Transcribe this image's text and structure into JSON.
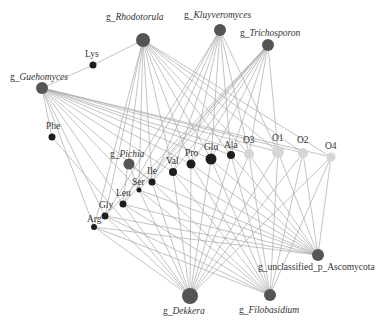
{
  "diagram": {
    "type": "network",
    "colors": {
      "fungus": "#555555",
      "amino_acid": "#1e1e1e",
      "organic_acid": "#d6d6d6",
      "edge": "#a8a8a8",
      "label": "#333333"
    },
    "nodes": [
      {
        "id": "rhodotorula",
        "prefix": "g_",
        "name": "Rhodotorula",
        "italic": true,
        "group": "fungus",
        "x": 143,
        "y": 40,
        "r": 7,
        "lx": 106,
        "ly": 20
      },
      {
        "id": "kluyveromyces",
        "prefix": "g_",
        "name": "Kluyveromyces",
        "italic": true,
        "group": "fungus",
        "x": 220,
        "y": 30,
        "r": 6,
        "lx": 184,
        "ly": 18
      },
      {
        "id": "trichosporon",
        "prefix": "g_",
        "name": "Trichosporon",
        "italic": true,
        "group": "fungus",
        "x": 268,
        "y": 45,
        "r": 6,
        "lx": 240,
        "ly": 36
      },
      {
        "id": "lys",
        "prefix": "",
        "name": "Lys",
        "italic": false,
        "group": "amino_acid",
        "x": 93,
        "y": 65,
        "r": 3.5,
        "lx": 85,
        "ly": 57
      },
      {
        "id": "guehomyces",
        "prefix": "g_",
        "name": "Guehomyces",
        "italic": true,
        "group": "fungus",
        "x": 42,
        "y": 88,
        "r": 6,
        "lx": 10,
        "ly": 80
      },
      {
        "id": "phe",
        "prefix": "",
        "name": "Phe",
        "italic": false,
        "group": "amino_acid",
        "x": 52,
        "y": 137,
        "r": 3.5,
        "lx": 46,
        "ly": 129
      },
      {
        "id": "pichia",
        "prefix": "g_",
        "name": "Pichia",
        "italic": true,
        "group": "fungus",
        "x": 129,
        "y": 164,
        "r": 5.5,
        "lx": 110,
        "ly": 157
      },
      {
        "id": "val",
        "prefix": "",
        "name": "Val",
        "italic": false,
        "group": "amino_acid",
        "x": 173,
        "y": 172,
        "r": 4,
        "lx": 166,
        "ly": 164
      },
      {
        "id": "pro",
        "prefix": "",
        "name": "Pro",
        "italic": false,
        "group": "amino_acid",
        "x": 191,
        "y": 164,
        "r": 4.5,
        "lx": 185,
        "ly": 156
      },
      {
        "id": "glu",
        "prefix": "",
        "name": "Glu",
        "italic": false,
        "group": "amino_acid",
        "x": 211,
        "y": 159,
        "r": 5.5,
        "lx": 204,
        "ly": 150
      },
      {
        "id": "ala",
        "prefix": "",
        "name": "Ala",
        "italic": false,
        "group": "amino_acid",
        "x": 231,
        "y": 155,
        "r": 4,
        "lx": 224,
        "ly": 148
      },
      {
        "id": "o3",
        "prefix": "",
        "name": "O3",
        "italic": false,
        "group": "organic_acid",
        "x": 249,
        "y": 154,
        "r": 5,
        "lx": 243,
        "ly": 143
      },
      {
        "id": "o1",
        "prefix": "",
        "name": "O1",
        "italic": false,
        "group": "organic_acid",
        "x": 278,
        "y": 152,
        "r": 6,
        "lx": 272,
        "ly": 141
      },
      {
        "id": "o2",
        "prefix": "",
        "name": "O2",
        "italic": false,
        "group": "organic_acid",
        "x": 303,
        "y": 153,
        "r": 5,
        "lx": 297,
        "ly": 143
      },
      {
        "id": "o4",
        "prefix": "",
        "name": "O4",
        "italic": false,
        "group": "organic_acid",
        "x": 331,
        "y": 157,
        "r": 4.5,
        "lx": 325,
        "ly": 149
      },
      {
        "id": "ile",
        "prefix": "",
        "name": "Ile",
        "italic": false,
        "group": "amino_acid",
        "x": 152,
        "y": 182,
        "r": 3.5,
        "lx": 147,
        "ly": 174
      },
      {
        "id": "ser",
        "prefix": "",
        "name": "Ser",
        "italic": false,
        "group": "amino_acid",
        "x": 139,
        "y": 190,
        "r": 2.5,
        "lx": 132,
        "ly": 185
      },
      {
        "id": "leu",
        "prefix": "",
        "name": "Leu",
        "italic": false,
        "group": "amino_acid",
        "x": 123,
        "y": 204,
        "r": 3.5,
        "lx": 116,
        "ly": 196
      },
      {
        "id": "gly",
        "prefix": "",
        "name": "Gly",
        "italic": false,
        "group": "amino_acid",
        "x": 105,
        "y": 216,
        "r": 3.5,
        "lx": 99,
        "ly": 208
      },
      {
        "id": "arg",
        "prefix": "",
        "name": "Arg",
        "italic": false,
        "group": "amino_acid",
        "x": 94,
        "y": 227,
        "r": 3,
        "lx": 87,
        "ly": 222
      },
      {
        "id": "ascomycota",
        "prefix": "g_",
        "name": "unclassified_p_Ascomycota",
        "italic": false,
        "group": "fungus",
        "x": 318,
        "y": 255,
        "r": 6,
        "lx": 258,
        "ly": 270
      },
      {
        "id": "filobasidium",
        "prefix": "g_",
        "name": "Filobasidium",
        "italic": true,
        "group": "fungus",
        "x": 270,
        "y": 295,
        "r": 6,
        "lx": 239,
        "ly": 313
      },
      {
        "id": "dekkera",
        "prefix": "g_",
        "name": "Dekkera",
        "italic": true,
        "group": "fungus",
        "x": 190,
        "y": 296,
        "r": 8,
        "lx": 163,
        "ly": 314
      }
    ],
    "edges": [
      [
        "rhodotorula",
        "lys"
      ],
      [
        "lys",
        "guehomyces"
      ],
      [
        "rhodotorula",
        "val"
      ],
      [
        "rhodotorula",
        "pro"
      ],
      [
        "rhodotorula",
        "glu"
      ],
      [
        "rhodotorula",
        "ala"
      ],
      [
        "rhodotorula",
        "o3"
      ],
      [
        "rhodotorula",
        "o1"
      ],
      [
        "rhodotorula",
        "o2"
      ],
      [
        "rhodotorula",
        "o4"
      ],
      [
        "rhodotorula",
        "ile"
      ],
      [
        "rhodotorula",
        "ser"
      ],
      [
        "rhodotorula",
        "leu"
      ],
      [
        "rhodotorula",
        "gly"
      ],
      [
        "rhodotorula",
        "arg"
      ],
      [
        "kluyveromyces",
        "val"
      ],
      [
        "kluyveromyces",
        "pro"
      ],
      [
        "kluyveromyces",
        "glu"
      ],
      [
        "kluyveromyces",
        "ala"
      ],
      [
        "kluyveromyces",
        "o3"
      ],
      [
        "kluyveromyces",
        "o1"
      ],
      [
        "kluyveromyces",
        "ile"
      ],
      [
        "kluyveromyces",
        "leu"
      ],
      [
        "kluyveromyces",
        "gly"
      ],
      [
        "trichosporon",
        "val"
      ],
      [
        "trichosporon",
        "pro"
      ],
      [
        "trichosporon",
        "glu"
      ],
      [
        "trichosporon",
        "ala"
      ],
      [
        "trichosporon",
        "o3"
      ],
      [
        "trichosporon",
        "o1"
      ],
      [
        "trichosporon",
        "ile"
      ],
      [
        "trichosporon",
        "ser"
      ],
      [
        "trichosporon",
        "leu"
      ],
      [
        "trichosporon",
        "gly"
      ],
      [
        "guehomyces",
        "phe"
      ],
      [
        "guehomyces",
        "val"
      ],
      [
        "guehomyces",
        "pro"
      ],
      [
        "guehomyces",
        "glu"
      ],
      [
        "guehomyces",
        "ala"
      ],
      [
        "guehomyces",
        "o3"
      ],
      [
        "guehomyces",
        "o1"
      ],
      [
        "guehomyces",
        "o2"
      ],
      [
        "guehomyces",
        "o4"
      ],
      [
        "guehomyces",
        "ile"
      ],
      [
        "guehomyces",
        "ser"
      ],
      [
        "guehomyces",
        "leu"
      ],
      [
        "guehomyces",
        "gly"
      ],
      [
        "guehomyces",
        "arg"
      ],
      [
        "pichia",
        "ser"
      ],
      [
        "pichia",
        "ile"
      ],
      [
        "dekkera",
        "phe"
      ],
      [
        "dekkera",
        "val"
      ],
      [
        "dekkera",
        "pro"
      ],
      [
        "dekkera",
        "glu"
      ],
      [
        "dekkera",
        "ala"
      ],
      [
        "dekkera",
        "o3"
      ],
      [
        "dekkera",
        "o1"
      ],
      [
        "dekkera",
        "o2"
      ],
      [
        "dekkera",
        "o4"
      ],
      [
        "dekkera",
        "ile"
      ],
      [
        "dekkera",
        "ser"
      ],
      [
        "dekkera",
        "leu"
      ],
      [
        "dekkera",
        "gly"
      ],
      [
        "dekkera",
        "arg"
      ],
      [
        "filobasidium",
        "val"
      ],
      [
        "filobasidium",
        "pro"
      ],
      [
        "filobasidium",
        "glu"
      ],
      [
        "filobasidium",
        "ala"
      ],
      [
        "filobasidium",
        "o3"
      ],
      [
        "filobasidium",
        "o1"
      ],
      [
        "filobasidium",
        "o2"
      ],
      [
        "filobasidium",
        "o4"
      ],
      [
        "filobasidium",
        "ile"
      ],
      [
        "filobasidium",
        "ser"
      ],
      [
        "filobasidium",
        "leu"
      ],
      [
        "filobasidium",
        "gly"
      ],
      [
        "filobasidium",
        "arg"
      ],
      [
        "ascomycota",
        "val"
      ],
      [
        "ascomycota",
        "pro"
      ],
      [
        "ascomycota",
        "glu"
      ],
      [
        "ascomycota",
        "ala"
      ],
      [
        "ascomycota",
        "o3"
      ],
      [
        "ascomycota",
        "o1"
      ],
      [
        "ascomycota",
        "o2"
      ],
      [
        "ascomycota",
        "o4"
      ],
      [
        "ascomycota",
        "ile"
      ],
      [
        "ascomycota",
        "ser"
      ],
      [
        "ascomycota",
        "leu"
      ],
      [
        "ascomycota",
        "gly"
      ],
      [
        "ascomycota",
        "arg"
      ]
    ]
  }
}
